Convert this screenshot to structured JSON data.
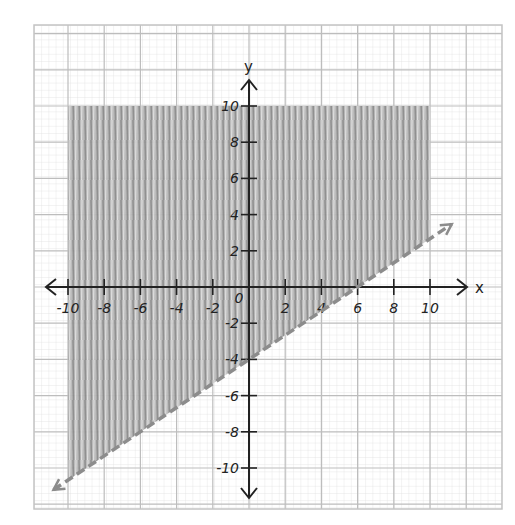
{
  "chart_data": {
    "type": "line",
    "title": "",
    "xlabel": "x",
    "ylabel": "y",
    "xlim": [
      -10,
      10
    ],
    "ylim": [
      -10,
      10
    ],
    "x_ticks": [
      -10,
      -8,
      -6,
      -4,
      -2,
      0,
      2,
      4,
      6,
      8,
      10
    ],
    "x_tick_labels": [
      "-10",
      "-8",
      "-6",
      "-4",
      "-2",
      "0",
      "2",
      "4",
      "6",
      "8",
      "10"
    ],
    "y_ticks": [
      -10,
      -8,
      -6,
      -4,
      -2,
      2,
      4,
      6,
      8,
      10
    ],
    "y_tick_labels": [
      "-10",
      "-8",
      "-6",
      "-4",
      "-2",
      "2",
      "4",
      "6",
      "8",
      "10"
    ],
    "grid": true,
    "legend": null,
    "series": [
      {
        "name": "boundary y = (2/3)x - 4",
        "style": "dashed",
        "color": "#8c8c8c",
        "x": [
          -10.8,
          11.2
        ],
        "y": [
          -11.2,
          3.47
        ]
      }
    ],
    "shaded_region": {
      "description": "y > (2/3)x - 4, bounded by -10 <= x <= 10, y <= 10",
      "color": "#9a9a9a",
      "polygon": [
        [
          -10,
          10
        ],
        [
          10,
          10
        ],
        [
          10,
          2.67
        ],
        [
          -10,
          -10.67
        ]
      ]
    },
    "annotations": [
      "x",
      "y"
    ]
  },
  "axes": {
    "x_label": "x",
    "y_label": "y"
  }
}
